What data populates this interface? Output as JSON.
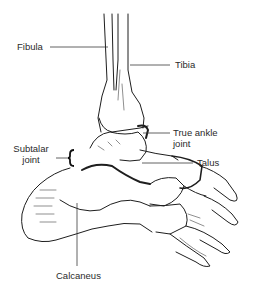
{
  "diagram": {
    "line_color": "#1e1e1e",
    "leader_color": "#3a3a3a",
    "background": "#ffffff",
    "labels": {
      "fibula": "Fibula",
      "tibia": "Tibia",
      "true_ankle_joint_line1": "True ankle",
      "true_ankle_joint_line2": "joint",
      "subtalar_joint_line1": "Subtalar",
      "subtalar_joint_line2": "joint",
      "talus": "Talus",
      "calcaneus": "Calcaneus"
    }
  }
}
